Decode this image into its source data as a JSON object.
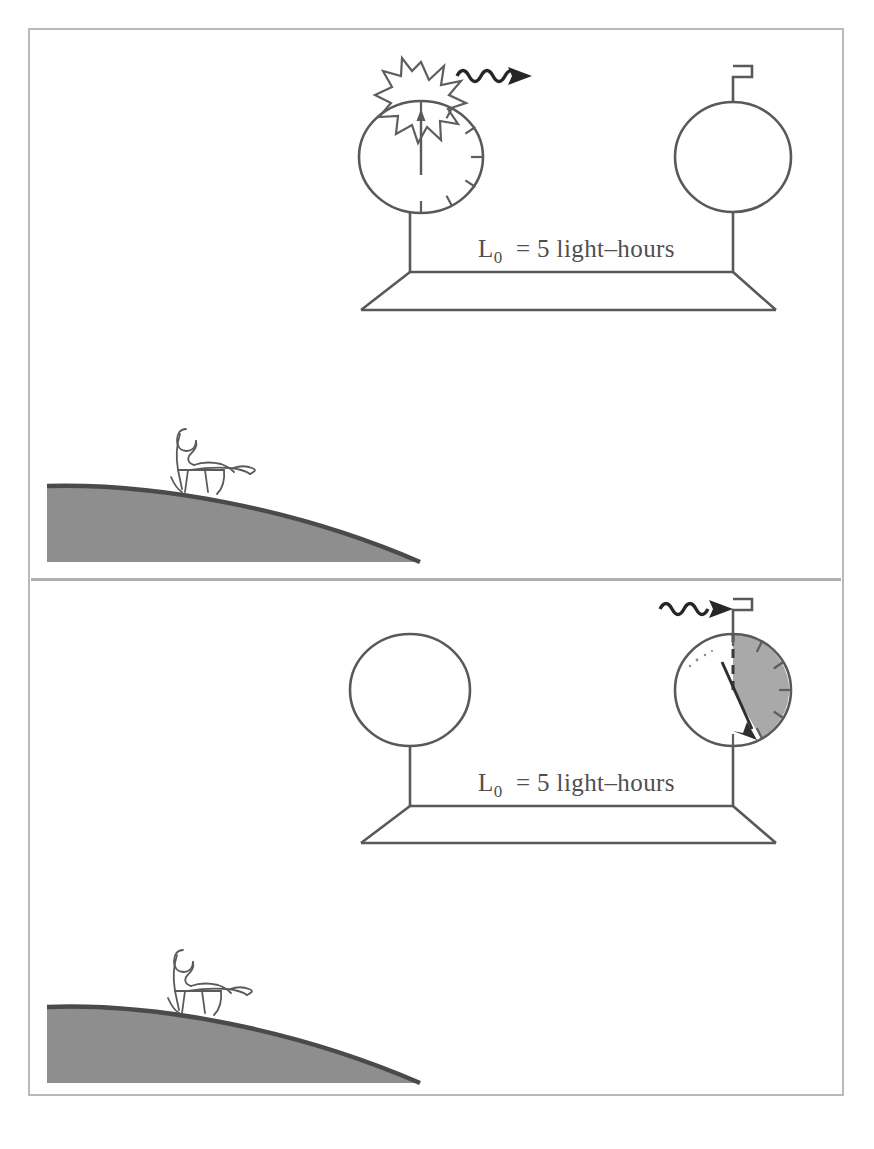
{
  "figure": {
    "background_color": "#ffffff",
    "frame_color": "#b9b9b9",
    "width": 874,
    "height": 1149
  },
  "colors": {
    "ink": "#595959",
    "dark_ink": "#262626",
    "hill_fill": "#8e8e8e",
    "hill_edge": "#4a4a4a",
    "sector_fill": "#a9a9a9",
    "frame": "#b9b9b9",
    "divider": "#b0b0b0"
  },
  "panels": [
    {
      "id": "panel-top",
      "name": "emission-panel",
      "distance_label": {
        "symbol": "L",
        "subscript": "0",
        "equals": "=",
        "value": "5",
        "unit": "light–hours",
        "full_text": "L0 = 5 light–hours"
      },
      "left_clock": {
        "name": "emitting-clock",
        "reading_hours": 0,
        "has_flash": true,
        "has_hand": true,
        "hand_points_to_hour": 12,
        "has_tick_marks": true,
        "tick_hours": [
          12,
          1,
          2,
          3,
          4,
          5,
          6
        ],
        "shaded_sector": false,
        "has_receiver_antenna": false
      },
      "right_clock": {
        "name": "receiving-clock",
        "reading_hours": 0,
        "has_flash": false,
        "has_hand": false,
        "has_tick_marks": false,
        "shaded_sector": false,
        "has_receiver_antenna": true
      },
      "signal": {
        "name": "light-pulse",
        "glyph": "squiggle-arrow",
        "direction": "rightward",
        "state": "just-emitted"
      },
      "observer": {
        "name": "seated-observer",
        "posture": "sitting-in-chair",
        "facing": "right",
        "on": "hillside"
      }
    },
    {
      "id": "panel-bottom",
      "name": "reception-panel",
      "distance_label": {
        "symbol": "L",
        "subscript": "0",
        "equals": "=",
        "value": "5",
        "unit": "light–hours",
        "full_text": "L0 = 5 light–hours"
      },
      "left_clock": {
        "name": "emitting-clock",
        "reading_hours": 0,
        "has_flash": false,
        "has_hand": false,
        "has_tick_marks": false,
        "shaded_sector": false,
        "has_receiver_antenna": false
      },
      "right_clock": {
        "name": "receiving-clock",
        "reading_hours": 5,
        "has_flash": false,
        "has_hand": true,
        "hand_points_to_hour": 5,
        "has_tick_marks": true,
        "tick_hours": [
          12,
          1,
          2,
          3,
          4,
          5,
          6
        ],
        "shaded_sector": true,
        "sector_from_hour": 12,
        "sector_to_hour": 5,
        "sector_meaning": "5 hours elapsed",
        "has_receiver_antenna": true,
        "dashed_reference_radius_hour": 12
      },
      "signal": {
        "name": "light-pulse",
        "glyph": "squiggle-arrow",
        "direction": "rightward",
        "state": "arriving-at-receiver"
      },
      "observer": {
        "name": "seated-observer",
        "posture": "sitting-in-chair",
        "facing": "right",
        "on": "hillside"
      }
    }
  ],
  "icons": {
    "flash": "starburst-icon",
    "antenna": "receiver-antenna-icon",
    "wave": "squiggle-wave-arrow-icon",
    "hand": "clock-hand-arrow-icon",
    "hill": "hill-slope-icon",
    "chair": "chair-icon",
    "person": "stick-figure-icon",
    "platform": "perspective-platform-icon"
  }
}
